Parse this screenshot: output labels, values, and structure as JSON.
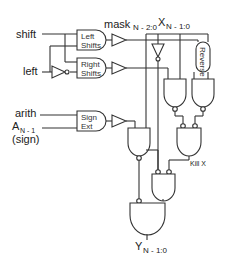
{
  "diagram": {
    "type": "logic-circuit",
    "inputs": [
      {
        "id": "shift",
        "label": "shift"
      },
      {
        "id": "left",
        "label": "left"
      },
      {
        "id": "arith",
        "label": "arith"
      },
      {
        "id": "a_msb",
        "label": "A",
        "sub": "N - 1"
      },
      {
        "id": "sign",
        "label": "(sign)"
      }
    ],
    "top_buses": [
      {
        "id": "mask",
        "label": "mask",
        "sub": "N - 2:0"
      },
      {
        "id": "x",
        "label": "X",
        "sub": "N - 1:0"
      }
    ],
    "blocks": [
      {
        "id": "left_shifts",
        "line1": "Left",
        "line2": "Shifts"
      },
      {
        "id": "right_shifts",
        "line1": "Right",
        "line2": "Shifts"
      },
      {
        "id": "sign_ext",
        "line1": "Sign",
        "line2": "Ext"
      },
      {
        "id": "reverse",
        "label": "Reverse"
      }
    ],
    "annotations": {
      "kill": "Kill X"
    },
    "output": {
      "label": "Y",
      "sub": "N - 1:0"
    }
  }
}
